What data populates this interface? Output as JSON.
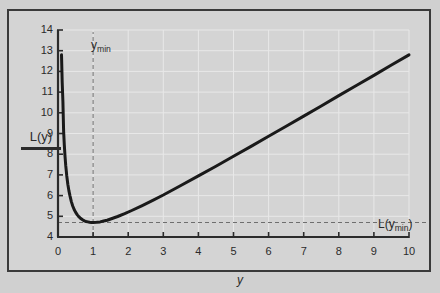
{
  "figure": {
    "background_color": "#d0d0d0",
    "plot_background_color": "#d4d4d4",
    "frame_color": "#3a3a3a",
    "curve_color": "#1a1a1a",
    "grid_color": "#e8e8e8",
    "dash_color": "#6e6e6e"
  },
  "labels": {
    "y_axis_label": "L(y)",
    "x_axis_label": "y",
    "ymin_marker": "y",
    "ymin_marker_sub": "min",
    "lymin_marker_prefix": "L(y",
    "lymin_marker_sub": "min",
    "lymin_marker_suffix": ")"
  },
  "chart_data": {
    "type": "line",
    "title": "",
    "xlabel": "y",
    "ylabel": "L(y)",
    "xlim": [
      0,
      10
    ],
    "ylim": [
      4,
      14
    ],
    "xticks": [
      0,
      1,
      2,
      3,
      4,
      5,
      6,
      7,
      8,
      9,
      10
    ],
    "xtick_labels": [
      "0",
      "1",
      "2",
      "3",
      "4",
      "5",
      "6",
      "7",
      "8",
      "9",
      "10"
    ],
    "yticks": [
      4,
      5,
      6,
      7,
      8,
      9,
      10,
      11,
      12,
      13,
      14
    ],
    "ytick_labels": [
      "4",
      "5",
      "6",
      "7",
      "8",
      "9",
      "10",
      "11",
      "12",
      "13",
      "14"
    ],
    "grid": true,
    "legend": false,
    "series": [
      {
        "name": "L(y)",
        "formula": "L(y) = y + 1/y + 2.7",
        "x": [
          0.1,
          0.12,
          0.14,
          0.16,
          0.18,
          0.2,
          0.22,
          0.25,
          0.28,
          0.31,
          0.34,
          0.38,
          0.42,
          0.46,
          0.5,
          0.55,
          0.6,
          0.65,
          0.7,
          0.75,
          0.8,
          0.85,
          0.9,
          0.95,
          1.0,
          1.1,
          1.2,
          1.3,
          1.4,
          1.5,
          1.7,
          1.9,
          2.1,
          2.4,
          2.7,
          3.0,
          3.5,
          4.0,
          4.5,
          5.0,
          5.5,
          6.0,
          6.5,
          7.0,
          7.5,
          8.0,
          8.5,
          9.0,
          9.5,
          10.0
        ],
        "y": [
          12.8,
          11.45,
          10.54,
          9.11,
          8.44,
          7.9,
          7.46,
          6.95,
          6.55,
          6.24,
          6.0,
          5.71,
          5.5,
          5.33,
          5.2,
          5.07,
          4.97,
          4.89,
          4.83,
          4.78,
          4.75,
          4.73,
          4.71,
          4.7,
          4.7,
          4.71,
          4.73,
          4.77,
          4.81,
          4.87,
          4.99,
          5.13,
          5.28,
          5.52,
          5.77,
          6.03,
          6.49,
          6.95,
          7.42,
          7.9,
          8.38,
          8.87,
          9.35,
          9.84,
          10.33,
          10.83,
          11.32,
          11.81,
          12.31,
          12.8
        ]
      }
    ],
    "annotations": [
      {
        "name": "ymin-vertical-dashed",
        "type": "vline",
        "x": 1.0,
        "y_from": 4.0,
        "y_to": 13.9,
        "label": "y_min"
      },
      {
        "name": "lymin-horizontal-dashed",
        "type": "hline",
        "y": 4.7,
        "x_from": 0.0,
        "x_to": 10.0,
        "label": "L(y_min)"
      }
    ],
    "minimum_point": {
      "x": 1.0,
      "y": 4.7
    }
  }
}
